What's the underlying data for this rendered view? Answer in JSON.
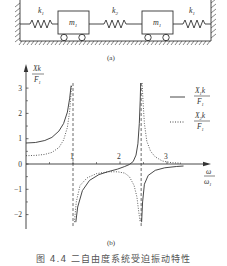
{
  "diagram": {
    "label": "(a)",
    "springs": [
      {
        "name": "left-spring",
        "label": "k",
        "sub": "1"
      },
      {
        "name": "middle-spring",
        "label": "k",
        "sub": "2"
      },
      {
        "name": "right-spring",
        "label": "k",
        "sub": "1"
      }
    ],
    "masses": [
      {
        "name": "mass-1",
        "label": "m",
        "sub": "1"
      },
      {
        "name": "mass-2",
        "label": "m",
        "sub": "1"
      }
    ]
  },
  "plot_label": "(b)",
  "caption": "图 4.4  二自由度系统受迫振动特性",
  "chart_data": {
    "type": "line",
    "title": "",
    "xlabel": "ω/ω1",
    "ylabel": "Xk/F1",
    "xlim": [
      0,
      3.4
    ],
    "ylim": [
      -2.3,
      3.3
    ],
    "x_ticks": [
      1,
      2,
      3
    ],
    "x_tick_labels": [
      "1",
      "2",
      "3"
    ],
    "y_ticks": [
      -2,
      -1,
      0,
      1,
      2,
      3
    ],
    "y_tick_labels": [
      "−2",
      "−1",
      "0",
      "1",
      "2",
      "3"
    ],
    "grid": false,
    "legend_position": "right",
    "asymptotes_x": [
      1.0,
      2.45
    ],
    "series": [
      {
        "name": "X1k/F1",
        "style": "solid",
        "segments": [
          [
            [
              0,
              0.83
            ],
            [
              0.2,
              0.85
            ],
            [
              0.4,
              0.93
            ],
            [
              0.55,
              1.05
            ],
            [
              0.7,
              1.3
            ],
            [
              0.8,
              1.6
            ],
            [
              0.88,
              2.05
            ],
            [
              0.93,
              2.6
            ],
            [
              0.96,
              3.1
            ]
          ],
          [
            [
              1.06,
              -2.3
            ],
            [
              1.1,
              -1.7
            ],
            [
              1.2,
              -1.05
            ],
            [
              1.35,
              -0.65
            ],
            [
              1.55,
              -0.42
            ],
            [
              1.75,
              -0.3
            ],
            [
              1.95,
              -0.2
            ],
            [
              2.1,
              -0.1
            ],
            [
              2.2,
              -0.02
            ],
            [
              2.28,
              0.1
            ],
            [
              2.34,
              0.35
            ],
            [
              2.38,
              0.8
            ],
            [
              2.41,
              1.6
            ],
            [
              2.43,
              2.5
            ],
            [
              2.44,
              3.2
            ]
          ],
          [
            [
              2.46,
              -2.3
            ],
            [
              2.48,
              -1.5
            ],
            [
              2.52,
              -0.8
            ],
            [
              2.6,
              -0.45
            ],
            [
              2.75,
              -0.25
            ],
            [
              2.95,
              -0.15
            ],
            [
              3.2,
              -0.1
            ],
            [
              3.35,
              -0.08
            ]
          ]
        ]
      },
      {
        "name": "X2k/F1",
        "style": "dotted",
        "segments": [
          [
            [
              0,
              0.33
            ],
            [
              0.2,
              0.34
            ],
            [
              0.4,
              0.38
            ],
            [
              0.55,
              0.46
            ],
            [
              0.7,
              0.65
            ],
            [
              0.8,
              0.95
            ],
            [
              0.88,
              1.45
            ],
            [
              0.93,
              2.1
            ],
            [
              0.97,
              3.1
            ]
          ],
          [
            [
              1.03,
              -2.3
            ],
            [
              1.07,
              -1.5
            ],
            [
              1.15,
              -0.85
            ],
            [
              1.3,
              -0.55
            ],
            [
              1.5,
              -0.38
            ],
            [
              1.75,
              -0.31
            ],
            [
              1.95,
              -0.31
            ],
            [
              2.1,
              -0.36
            ],
            [
              2.2,
              -0.5
            ],
            [
              2.3,
              -0.85
            ],
            [
              2.36,
              -1.3
            ],
            [
              2.4,
              -1.9
            ],
            [
              2.43,
              -2.3
            ]
          ],
          [
            [
              2.47,
              3.2
            ],
            [
              2.49,
              2.5
            ],
            [
              2.52,
              1.6
            ],
            [
              2.57,
              0.9
            ],
            [
              2.65,
              0.5
            ],
            [
              2.75,
              0.28
            ],
            [
              2.9,
              0.12
            ],
            [
              3.1,
              0.05
            ],
            [
              3.3,
              0.03
            ]
          ]
        ]
      }
    ],
    "legend": [
      {
        "style": "solid",
        "num": "X1k",
        "den": "F1"
      },
      {
        "style": "dotted",
        "num": "X2k",
        "den": "F1"
      }
    ]
  }
}
